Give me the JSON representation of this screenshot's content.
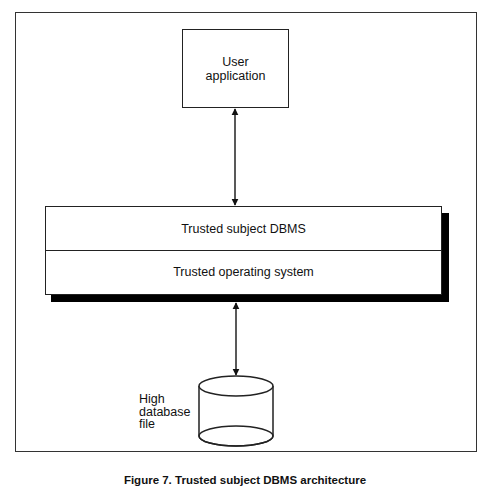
{
  "diagram": {
    "user_box": {
      "line1": "User",
      "line2": "application"
    },
    "stack": {
      "top_layer": "Trusted subject DBMS",
      "bottom_layer": "Trusted operating system"
    },
    "database": {
      "line1": "High",
      "line2": "database",
      "line3": "file"
    },
    "connections": [
      {
        "from": "User application",
        "to": "Trusted subject DBMS",
        "type": "bidirectional-arrow"
      },
      {
        "from": "Trusted operating system",
        "to": "High database file",
        "type": "bidirectional-arrow"
      }
    ],
    "caption": "Figure 7. Trusted subject DBMS architecture"
  },
  "colors": {
    "line": "#222222",
    "shadow": "#000000",
    "background": "#ffffff"
  }
}
